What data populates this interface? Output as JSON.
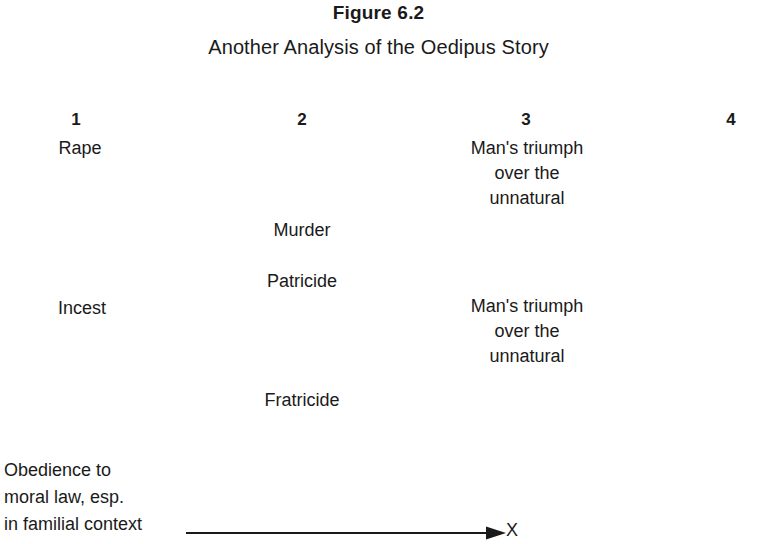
{
  "figure": {
    "number": "Figure 6.2",
    "subtitle": "Another Analysis of the Oedipus Story",
    "background_color": "#ffffff",
    "text_color": "#1a1a1a"
  },
  "columns": [
    {
      "number": "1",
      "entries": [
        "Rape",
        "Incest"
      ]
    },
    {
      "number": "2",
      "entries": [
        "Murder",
        "Patricide",
        "Fratricide"
      ]
    },
    {
      "number": "3",
      "entries": [
        "Man's triumph\nover the\nunnatural",
        "Man's triumph\nover the\nunnatural"
      ]
    },
    {
      "number": "4",
      "entries": []
    }
  ],
  "entries": {
    "col1_rape": "Rape",
    "col1_incest": "Incest",
    "col2_murder": "Murder",
    "col2_patricide": "Patricide",
    "col2_fratricide": "Fratricide",
    "col3_triumph_upper": "Man's triumph\nover the\nunnatural",
    "col3_triumph_lower": "Man's triumph\nover the\nunnatural"
  },
  "axis": {
    "label": "Obedience to\nmoral law, esp.\nin familial context",
    "endpoint_label": "X",
    "arrow_direction": "right",
    "line_color": "#1a1a1a"
  }
}
